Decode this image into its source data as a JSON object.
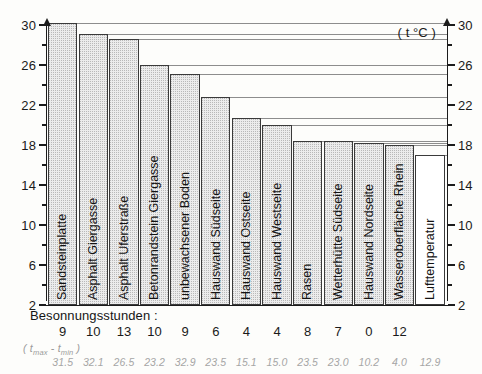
{
  "chart_data": {
    "type": "bar",
    "title": "",
    "xlabel": "",
    "ylabel": "",
    "unit_label": "( t °C )",
    "ylim": [
      2,
      30
    ],
    "yticks": [
      30,
      26,
      22,
      18,
      14,
      10,
      6,
      2
    ],
    "minor_tick_step": 2,
    "grid": false,
    "leader_lines": true,
    "dual_axis": true,
    "categories": [
      "Sandsteinplatte",
      "Asphalt Giergasse",
      "Asphalt Uferstraße",
      "Betonrandstein Giergasse",
      "unbewachsener Boden",
      "Hauswand Südseite",
      "Hauswand Ostseite",
      "Hauswand Westseite",
      "Rasen",
      "Wetterhütte Südseite",
      "Hauswand Nordseite",
      "Wasseroberfläche Rhein",
      "Lufttemperatur"
    ],
    "values": [
      30.2,
      29.1,
      28.6,
      26.0,
      25.1,
      22.8,
      20.7,
      20.0,
      18.4,
      18.4,
      18.2,
      18.0,
      17.0
    ],
    "series": [
      {
        "name": "Maximaltemperatur",
        "values": [
          30.2,
          29.1,
          28.6,
          26.0,
          25.1,
          22.8,
          20.7,
          20.0,
          18.4,
          18.4,
          18.2,
          18.0,
          17.0
        ]
      }
    ],
    "sun_hours_label": "Besonnungsstunden :",
    "sun_hours": [
      "9",
      "10",
      "13",
      "10",
      "9",
      "6",
      "4",
      "4",
      "8",
      "7",
      "0",
      "12",
      ""
    ],
    "delta_label": "( t",
    "delta_label_sub_max": "max",
    "delta_label_dash": " - t",
    "delta_label_sub_min": "min",
    "delta_label_close": " )",
    "delta_values": [
      "31.5",
      "32.1",
      "26.5",
      "23.2",
      "32.9",
      "23.5",
      "15.1",
      "15.0",
      "23.5",
      "23.0",
      "10.2",
      "4.0",
      "12.9"
    ],
    "highlight_index": 12,
    "highlight_style": "hatched",
    "colors": {
      "bar_fill": "#ececec",
      "bar_stroke": "#3a3a3a",
      "axis": "#1c1c1c",
      "leader": "#8d8d8d",
      "delta_text": "#a6a6a6"
    }
  }
}
